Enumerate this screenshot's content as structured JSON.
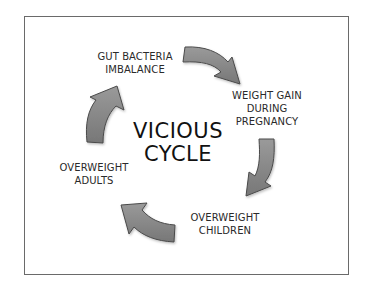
{
  "diagram": {
    "title": {
      "line1": "VICIOUS",
      "line2": "CYCLE"
    },
    "nodes": [
      {
        "id": "gut",
        "lines": [
          "GUT BACTERIA",
          "IMBALANCE"
        ]
      },
      {
        "id": "pregnancy",
        "lines": [
          "WEIGHT GAIN",
          "DURING",
          "PREGNANCY"
        ]
      },
      {
        "id": "children",
        "lines": [
          "OVERWEIGHT",
          "CHILDREN"
        ]
      },
      {
        "id": "adults",
        "lines": [
          "OVERWEIGHT",
          "ADULTS"
        ]
      }
    ],
    "arrows": [
      {
        "from": "gut",
        "to": "pregnancy",
        "icon": "curved-arrow-right-icon"
      },
      {
        "from": "pregnancy",
        "to": "children",
        "icon": "curved-arrow-down-icon"
      },
      {
        "from": "children",
        "to": "adults",
        "icon": "curved-arrow-left-icon"
      },
      {
        "from": "adults",
        "to": "gut",
        "icon": "curved-arrow-up-icon"
      }
    ],
    "colors": {
      "arrow_fill": "#8a8a8a",
      "arrow_stroke": "#4a4a4a",
      "frame_border": "#6a6a6a",
      "text": "#2a2a2a"
    }
  }
}
